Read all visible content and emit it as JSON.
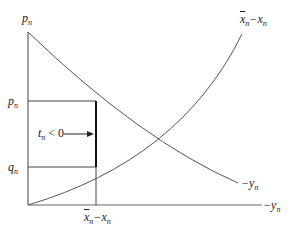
{
  "diagram": {
    "axes": {
      "y_label": "p",
      "y_label_sub": "n",
      "x_label": "−y",
      "x_label_sub": "n"
    },
    "levels": {
      "p": {
        "text": "p",
        "sub": "n"
      },
      "q": {
        "text": "q",
        "sub": "n"
      }
    },
    "curves": {
      "rising": {
        "label_bar": "x",
        "label_sub1": "n",
        "label_mid": "−x",
        "label_sub2": "n"
      },
      "falling": {
        "label": "−y",
        "label_sub": "n"
      }
    },
    "annotation": {
      "text": "t",
      "sub": "n",
      "rest": " < 0"
    },
    "x_marker": {
      "bar": "x",
      "sub1": "n",
      "mid": "−x",
      "sub2": "n"
    },
    "colors": {
      "line": "#444444",
      "thick_line": "#111111",
      "text": "#222222"
    }
  }
}
